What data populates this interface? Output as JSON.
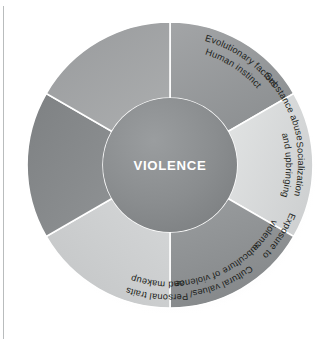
{
  "diagram": {
    "center": {
      "label": "VIOLENCE",
      "fill": "#8a8d8f",
      "text_color": "#ffffff"
    },
    "background": "#ffffff",
    "divider_color": "#ffffff",
    "segments": [
      {
        "id": "evolutionary-factors",
        "line1": "Evolutionary factors",
        "line2": "Human instinct",
        "fill": "#97999b",
        "text_color": "#1d1f20",
        "start_angle": 0,
        "end_angle": 60
      },
      {
        "id": "substance-abuse",
        "line1": "Substance abuse",
        "line2": "",
        "fill": "#d8dadb",
        "text_color": "#1d1f20",
        "start_angle": 60,
        "end_angle": 120
      },
      {
        "id": "socialization-and-upbringing",
        "line1": "Socialization",
        "line2": "and upbringing",
        "fill": "#8e9193",
        "text_color": "#1d1f20",
        "start_angle": 120,
        "end_angle": 180
      },
      {
        "id": "exposure-to-violence",
        "line1": "Exposure to",
        "line2": "violence",
        "fill": "#cbcdce",
        "text_color": "#1d1f20",
        "start_angle": 180,
        "end_angle": 240
      },
      {
        "id": "cultural-values-subculture-of-violence",
        "line1": "Cultural values/",
        "line2": "subculture of violence",
        "fill": "#86898b",
        "text_color": "#1d1f20",
        "start_angle": 240,
        "end_angle": 300
      },
      {
        "id": "personal-traits-and-makeup",
        "line1": "Personal traits",
        "line2": "and makeup",
        "fill": "#a2a5a6",
        "text_color": "#1d1f20",
        "start_angle": 300,
        "end_angle": 360
      }
    ]
  }
}
